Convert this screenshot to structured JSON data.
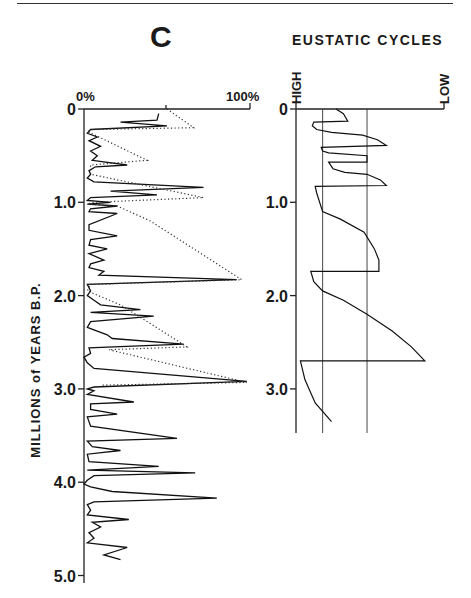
{
  "figure": {
    "panel_label": "C",
    "left_chart_title": "",
    "right_chart_title": "EUSTATIC CYCLES",
    "y_axis_label": "MILLIONS of YEARS B.P."
  },
  "chart_data": [
    {
      "type": "line",
      "title": "",
      "panel": "C",
      "xlabel": "",
      "ylabel": "MILLIONS of YEARS B.P.",
      "x_tick_labels": [
        "0%",
        "100%"
      ],
      "xlim": [
        0,
        100
      ],
      "ylim": [
        0,
        5.0
      ],
      "y_inverted": true,
      "y_ticks": [
        0,
        1.0,
        2.0,
        3.0,
        4.0,
        5.0
      ],
      "y_tick_labels": [
        "0",
        "1.0",
        "2.0",
        "3.0",
        "4.0",
        "5.0"
      ],
      "grid": false,
      "series": [
        {
          "name": "percent (solid)",
          "style": "solid",
          "points": [
            [
              45,
              0.05
            ],
            [
              44,
              0.12
            ],
            [
              22,
              0.14
            ],
            [
              50,
              0.18
            ],
            [
              4,
              0.22
            ],
            [
              2,
              0.26
            ],
            [
              8,
              0.3
            ],
            [
              3,
              0.34
            ],
            [
              10,
              0.4
            ],
            [
              4,
              0.45
            ],
            [
              8,
              0.5
            ],
            [
              5,
              0.55
            ],
            [
              26,
              0.6
            ],
            [
              7,
              0.62
            ],
            [
              3,
              0.66
            ],
            [
              4,
              0.7
            ],
            [
              2,
              0.74
            ],
            [
              6,
              0.78
            ],
            [
              72,
              0.84
            ],
            [
              16,
              0.88
            ],
            [
              44,
              0.92
            ],
            [
              4,
              0.95
            ],
            [
              2,
              0.98
            ],
            [
              16,
              1.0
            ],
            [
              2,
              1.02
            ],
            [
              20,
              1.04
            ],
            [
              4,
              1.07
            ],
            [
              3,
              1.1
            ],
            [
              20,
              1.12
            ],
            [
              3,
              1.24
            ],
            [
              3,
              1.3
            ],
            [
              20,
              1.36
            ],
            [
              4,
              1.4
            ],
            [
              3,
              1.46
            ],
            [
              14,
              1.5
            ],
            [
              3,
              1.55
            ],
            [
              12,
              1.62
            ],
            [
              4,
              1.66
            ],
            [
              3,
              1.7
            ],
            [
              12,
              1.74
            ],
            [
              9,
              1.78
            ],
            [
              92,
              1.83
            ],
            [
              2,
              1.88
            ],
            [
              4,
              1.95
            ],
            [
              2,
              2.0
            ],
            [
              6,
              2.05
            ],
            [
              10,
              2.1
            ],
            [
              34,
              2.15
            ],
            [
              4,
              2.18
            ],
            [
              42,
              2.22
            ],
            [
              4,
              2.28
            ],
            [
              2,
              2.34
            ],
            [
              14,
              2.42
            ],
            [
              17,
              2.46
            ],
            [
              60,
              2.52
            ],
            [
              3,
              2.56
            ],
            [
              4,
              2.62
            ],
            [
              0,
              2.66
            ],
            [
              2,
              2.72
            ],
            [
              6,
              2.78
            ],
            [
              98,
              2.92
            ],
            [
              6,
              2.98
            ],
            [
              2,
              3.0
            ],
            [
              6,
              3.02
            ],
            [
              2,
              3.06
            ],
            [
              30,
              3.14
            ],
            [
              4,
              3.16
            ],
            [
              4,
              3.22
            ],
            [
              20,
              3.27
            ],
            [
              2,
              3.3
            ],
            [
              4,
              3.4
            ],
            [
              56,
              3.53
            ],
            [
              2,
              3.56
            ],
            [
              5,
              3.62
            ],
            [
              22,
              3.66
            ],
            [
              2,
              3.7
            ],
            [
              3,
              3.78
            ],
            [
              45,
              3.83
            ],
            [
              2,
              3.87
            ],
            [
              67,
              3.9
            ],
            [
              6,
              3.93
            ],
            [
              2,
              3.98
            ],
            [
              0,
              4.02
            ],
            [
              4,
              4.05
            ],
            [
              17,
              4.1
            ],
            [
              80,
              4.17
            ],
            [
              6,
              4.21
            ],
            [
              2,
              4.24
            ],
            [
              4,
              4.3
            ],
            [
              2,
              4.35
            ],
            [
              27,
              4.4
            ],
            [
              5,
              4.43
            ],
            [
              10,
              4.48
            ],
            [
              3,
              4.54
            ],
            [
              6,
              4.6
            ],
            [
              2,
              4.65
            ],
            [
              26,
              4.7
            ],
            [
              12,
              4.78
            ],
            [
              22,
              4.83
            ]
          ]
        },
        {
          "name": "percent (dotted envelope)",
          "style": "dotted",
          "points": [
            [
              50,
              0.0
            ],
            [
              66,
              0.2
            ],
            [
              5,
              0.22
            ],
            [
              2,
              0.24
            ],
            [
              38,
              0.55
            ],
            [
              4,
              0.6
            ],
            [
              4,
              0.7
            ],
            [
              72,
              0.95
            ],
            [
              6,
              1.0
            ],
            [
              2,
              1.02
            ],
            [
              20,
              1.04
            ],
            [
              40,
              1.2
            ],
            [
              95,
              1.83
            ],
            [
              4,
              1.88
            ],
            [
              2,
              1.95
            ],
            [
              22,
              2.1
            ],
            [
              40,
              2.3
            ],
            [
              62,
              2.55
            ],
            [
              15,
              2.58
            ],
            [
              98,
              2.93
            ],
            [
              10,
              2.96
            ]
          ]
        }
      ]
    },
    {
      "type": "line",
      "title": "EUSTATIC CYCLES",
      "xlabel": "",
      "x_tick_labels": [
        "HIGH",
        "LOW"
      ],
      "xlim": [
        0,
        100
      ],
      "ylim": [
        0,
        3.5
      ],
      "y_inverted": true,
      "y_ticks": [
        0,
        1.0,
        2.0,
        3.0
      ],
      "y_tick_labels": [
        "0",
        "1.0",
        "2.0",
        "3.0"
      ],
      "reference_lines_x": [
        18,
        48
      ],
      "series": [
        {
          "name": "eustatic sea level",
          "style": "solid",
          "points": [
            [
              27,
              0.0
            ],
            [
              32,
              0.05
            ],
            [
              35,
              0.13
            ],
            [
              12,
              0.14
            ],
            [
              11,
              0.18
            ],
            [
              14,
              0.22
            ],
            [
              24,
              0.25
            ],
            [
              45,
              0.28
            ],
            [
              55,
              0.33
            ],
            [
              61,
              0.39
            ],
            [
              17,
              0.41
            ],
            [
              18,
              0.45
            ],
            [
              22,
              0.47
            ],
            [
              48,
              0.5
            ],
            [
              48,
              0.57
            ],
            [
              22,
              0.57
            ],
            [
              25,
              0.64
            ],
            [
              33,
              0.68
            ],
            [
              48,
              0.7
            ],
            [
              57,
              0.76
            ],
            [
              61,
              0.82
            ],
            [
              13,
              0.83
            ],
            [
              14,
              0.9
            ],
            [
              18,
              1.1
            ],
            [
              30,
              1.18
            ],
            [
              46,
              1.32
            ],
            [
              53,
              1.5
            ],
            [
              56,
              1.62
            ],
            [
              56,
              1.74
            ],
            [
              10,
              1.74
            ],
            [
              12,
              1.85
            ],
            [
              18,
              1.95
            ],
            [
              32,
              2.05
            ],
            [
              48,
              2.2
            ],
            [
              65,
              2.38
            ],
            [
              78,
              2.55
            ],
            [
              87,
              2.7
            ],
            [
              87,
              2.7
            ],
            [
              3,
              2.7
            ],
            [
              6,
              2.9
            ],
            [
              13,
              3.15
            ],
            [
              24,
              3.35
            ]
          ]
        }
      ]
    }
  ]
}
